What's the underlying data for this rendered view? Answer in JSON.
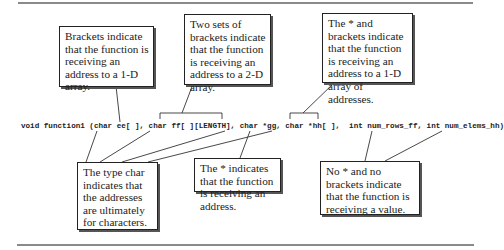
{
  "diagram": {
    "code_line": "void function1 (char ee[ ], char ff[ ][LENGTH], char *gg, char *hh[ ],  int num_rows_ff, int num_elems_hh)",
    "callouts": [
      {
        "id": "brackets-1d",
        "text": "Brackets indicate that the function is receiving an address to a 1-D array."
      },
      {
        "id": "two-brackets-2d",
        "text": "Two sets of brackets indicate that the function is receiving an address to a 2-D array."
      },
      {
        "id": "star-and-brackets",
        "text": "The * and brackets indicate that the function is receiving an address to a 1-D array of addresses."
      },
      {
        "id": "type-char",
        "text": "The type char indicates that the addresses are ultimately for characters."
      },
      {
        "id": "star-address",
        "text": "The * indicates that the function is receiving an address."
      },
      {
        "id": "no-star-value",
        "text": "No * and no brackets indicate that the function is receiving a value."
      }
    ]
  }
}
